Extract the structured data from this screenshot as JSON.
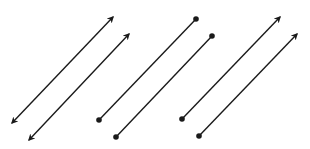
{
  "diagram": {
    "stroke_color": "#1a1a1a",
    "background": "#ffffff",
    "groups": [
      {
        "name": "parallel-lines",
        "kind": "line",
        "description": "Two parallel lines with arrowheads at both ends",
        "count": 2
      },
      {
        "name": "parallel-segments",
        "kind": "segment",
        "description": "Two parallel line segments with dot endpoints at both ends",
        "count": 2
      },
      {
        "name": "parallel-rays",
        "kind": "ray",
        "description": "Two parallel rays with a dot endpoint at lower-left and arrowhead at upper-right",
        "count": 2
      }
    ]
  }
}
